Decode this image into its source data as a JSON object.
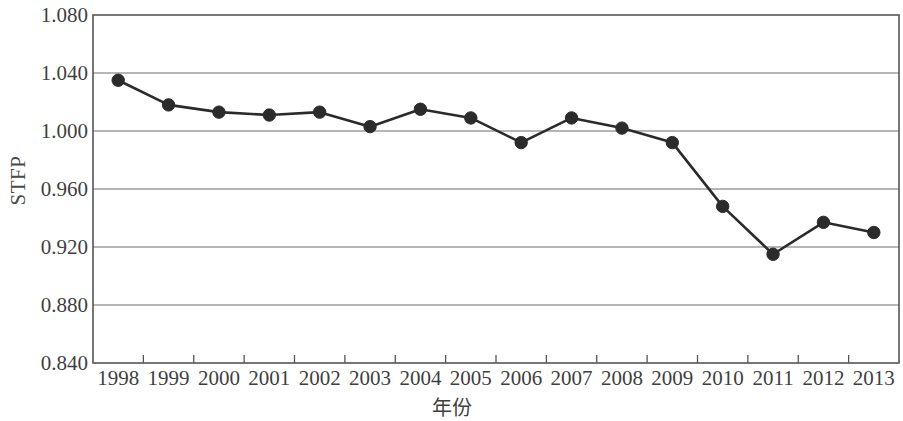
{
  "chart_data": {
    "type": "line",
    "title": "",
    "xlabel": "年份",
    "ylabel": "STFP",
    "categories": [
      "1998",
      "1999",
      "2000",
      "2001",
      "2002",
      "2003",
      "2004",
      "2005",
      "2006",
      "2007",
      "2008",
      "2009",
      "2010",
      "2011",
      "2012",
      "2013"
    ],
    "values": [
      1.035,
      1.018,
      1.013,
      1.011,
      1.013,
      1.003,
      1.015,
      1.009,
      0.992,
      1.009,
      1.002,
      0.992,
      0.948,
      0.915,
      0.937,
      0.93
    ],
    "series": [
      {
        "name": "STFP",
        "values": [
          1.035,
          1.018,
          1.013,
          1.011,
          1.013,
          1.003,
          1.015,
          1.009,
          0.992,
          1.009,
          1.002,
          0.992,
          0.948,
          0.915,
          0.937,
          0.93
        ]
      }
    ],
    "ylim": [
      0.84,
      1.08
    ],
    "yticks": [
      0.84,
      0.88,
      0.92,
      0.96,
      1.0,
      1.04,
      1.08
    ],
    "ytick_labels": [
      "0.840",
      "0.880",
      "0.920",
      "0.960",
      "1.000",
      "1.040",
      "1.080"
    ],
    "xtick_labels": [
      "1998",
      "1999",
      "2000",
      "2001",
      "2002",
      "2003",
      "2004",
      "2005",
      "2006",
      "2007",
      "2008",
      "2009",
      "2010",
      "2011",
      "2012",
      "2013"
    ],
    "grid": true,
    "grid_axis": "y",
    "legend": false,
    "legend_position": "none",
    "marker": "filled-circle",
    "line_color": "#2b2b2b",
    "marker_color": "#2b2b2b",
    "grid_color": "#6e6e6e",
    "background_color": "#ffffff"
  },
  "axes": {
    "y_title": "STFP",
    "x_title": "年份"
  }
}
